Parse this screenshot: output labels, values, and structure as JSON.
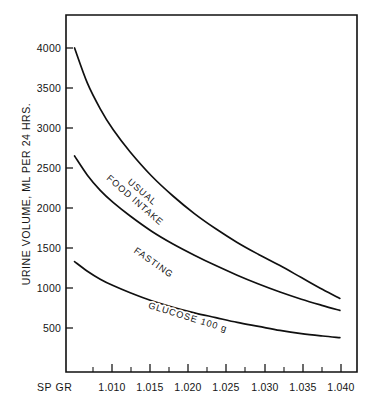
{
  "chart_data": {
    "type": "line",
    "title": "",
    "xlabel": "SP GR",
    "ylabel": "URINE VOLUME, ML PER 24 HRS.",
    "xlim": [
      1.0075,
      1.0415
    ],
    "ylim": [
      0,
      4400
    ],
    "grid": false,
    "legend_position": "inline-on-curve",
    "x_tick_labels": [
      "1.010",
      "1.015",
      "1.020",
      "1.025",
      "1.030",
      "1.035",
      "1.040"
    ],
    "x_tick_values": [
      1.01,
      1.015,
      1.02,
      1.025,
      1.03,
      1.035,
      1.04
    ],
    "x_minor_tick_values": [
      1.0075,
      1.0125,
      1.0175,
      1.0225,
      1.0275,
      1.0325,
      1.0375
    ],
    "y_tick_labels": [
      "500",
      "1000",
      "1500",
      "2000",
      "2500",
      "3000",
      "3500",
      "4000"
    ],
    "y_tick_values": [
      500,
      1000,
      1500,
      2000,
      2500,
      3000,
      3500,
      4000
    ],
    "x": [
      1.0085,
      1.01,
      1.0115,
      1.013,
      1.015,
      1.0175,
      1.02,
      1.0225,
      1.025,
      1.0275,
      1.03,
      1.0325,
      1.035,
      1.0375,
      1.0395
    ],
    "series": [
      {
        "name": "USUAL FOOD INTAKE",
        "label_lines": [
          "USUAL",
          "FOOD INTAKE"
        ],
        "values": [
          4000,
          3560,
          3240,
          2980,
          2700,
          2400,
          2150,
          1930,
          1740,
          1570,
          1420,
          1280,
          1130,
          980,
          870
        ]
      },
      {
        "name": "FASTING",
        "label_lines": [
          "FASTING"
        ],
        "values": [
          2650,
          2410,
          2220,
          2070,
          1900,
          1710,
          1550,
          1410,
          1280,
          1160,
          1050,
          950,
          860,
          780,
          720
        ]
      },
      {
        "name": "GLUCOSE 100 g",
        "label_lines": [
          "GLUCOSE 100 g"
        ],
        "values": [
          1330,
          1210,
          1110,
          1030,
          940,
          840,
          760,
          690,
          630,
          570,
          520,
          470,
          430,
          400,
          380
        ]
      }
    ],
    "colors": {
      "curve": "#101010",
      "axis": "#101010",
      "background": "#ffffff"
    }
  },
  "axes": {
    "y_title": "URINE VOLUME, ML PER 24 HRS.",
    "x_corner_label": "SP GR",
    "y_ticks": [
      {
        "label": "4000"
      },
      {
        "label": "3500"
      },
      {
        "label": "3000"
      },
      {
        "label": "2500"
      },
      {
        "label": "2000"
      },
      {
        "label": "1500"
      },
      {
        "label": "1000"
      },
      {
        "label": "500"
      }
    ],
    "x_ticks": [
      {
        "label": "1.010"
      },
      {
        "label": "1.015"
      },
      {
        "label": "1.020"
      },
      {
        "label": "1.025"
      },
      {
        "label": "1.030"
      },
      {
        "label": "1.035"
      },
      {
        "label": "1.040"
      }
    ]
  },
  "curve_labels": {
    "usual_line1": "USUAL",
    "usual_line2": "FOOD INTAKE",
    "fasting": "FASTING",
    "glucose": "GLUCOSE 100 g"
  }
}
